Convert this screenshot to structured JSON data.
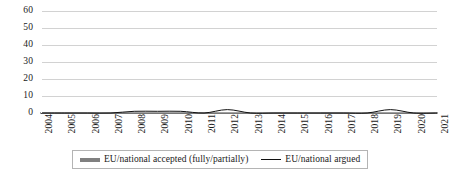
{
  "chart_data": {
    "type": "line",
    "title": "",
    "subtitle": "",
    "xlabel": "",
    "ylabel": "",
    "categories": [
      "2004",
      "2005",
      "2006",
      "2007",
      "2008",
      "2009",
      "2010",
      "2011",
      "2012",
      "2013",
      "2014",
      "2015",
      "2016",
      "2017",
      "2018",
      "2019",
      "2020",
      "2021"
    ],
    "series": [
      {
        "name": "EU/national accepted (fully/partially)",
        "color": "#808080",
        "style": "thick-line",
        "values": [
          0,
          0,
          0,
          0,
          0,
          0,
          0,
          0,
          0,
          0,
          0,
          0,
          0,
          0,
          0,
          0,
          0,
          0
        ]
      },
      {
        "name": "EU/national argued",
        "color": "#111111",
        "style": "thin-line",
        "values": [
          0,
          0,
          0,
          0,
          1,
          1,
          1,
          0,
          2,
          0,
          0,
          0,
          0,
          0,
          0,
          2,
          0,
          0
        ]
      }
    ],
    "ylim": [
      0,
      60
    ],
    "yticks": [
      0,
      10,
      20,
      30,
      40,
      50,
      60
    ],
    "ytick_labels": [
      "0",
      "10",
      "20",
      "30",
      "40",
      "50",
      "60"
    ],
    "grid": "horizontal",
    "legend_position": "bottom"
  },
  "legend": {
    "entries": [
      {
        "label": "EU/national accepted (fully/partially)",
        "swatch": "thick-gray-line-swatch"
      },
      {
        "label": "EU/national argued",
        "swatch": "thin-black-line-swatch"
      }
    ]
  },
  "colors": {
    "gridline": "#d2d2d2",
    "axis": "#5a5a5a",
    "series_accepted": "#808080",
    "series_argued": "#111111",
    "legend_border": "#b4b4b4",
    "background": "#ffffff",
    "text": "#1a1a1a"
  }
}
